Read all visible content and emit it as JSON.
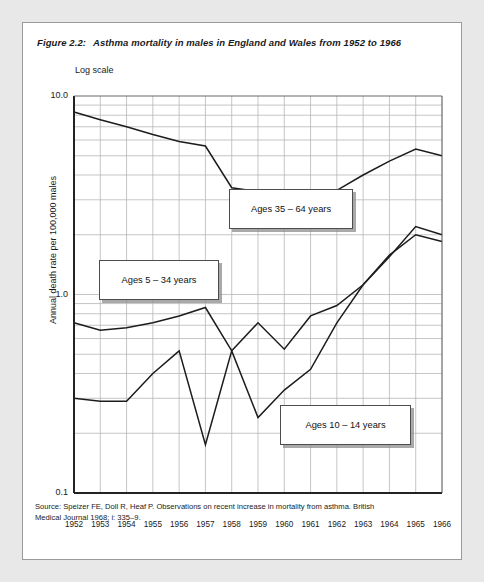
{
  "figure": {
    "number": "Figure 2.2:",
    "title": "Asthma mortality in males in England and Wales from 1952 to 1966",
    "scale_note": "Log scale"
  },
  "source": {
    "line1": "Source: Speizer FE, Doll R, Heaf P. Observations on recent increase in mortality from asthma. British",
    "line2": "Medical Journal 1968; i: 335–9."
  },
  "callouts": [
    {
      "id": "ages-35-64",
      "label": "Ages 35 – 64 years",
      "x": 228,
      "y": 188,
      "w": 124,
      "h": 40
    },
    {
      "id": "ages-5-34",
      "label": "Ages 5 – 34 years",
      "x": 98,
      "y": 259,
      "w": 120,
      "h": 40
    },
    {
      "id": "ages-10-14",
      "label": "Ages 10 – 14 years",
      "x": 279,
      "y": 404,
      "w": 131,
      "h": 40
    }
  ],
  "chart_data": {
    "type": "line",
    "title": "Asthma mortality in males in England and Wales from 1952 to 1966",
    "xlabel": "",
    "ylabel": "Annual death rate per 100,000 males",
    "yscale": "log",
    "ylim": [
      0.1,
      10.0
    ],
    "ytick_labels": [
      "10.0",
      "1.0",
      "0.1"
    ],
    "ytick_values": [
      10.0,
      1.0,
      0.1
    ],
    "grid": true,
    "legend": "inline-callouts",
    "x": [
      1952,
      1953,
      1954,
      1955,
      1956,
      1957,
      1958,
      1959,
      1960,
      1961,
      1962,
      1963,
      1964,
      1965,
      1966
    ],
    "categories": [
      "1952",
      "1953",
      "1954",
      "1955",
      "1956",
      "1957",
      "1958",
      "1959",
      "1960",
      "1961",
      "1962",
      "1963",
      "1964",
      "1965",
      "1966"
    ],
    "series": [
      {
        "name": "Ages 35 – 64 years",
        "values": [
          8.3,
          7.6,
          7.0,
          6.4,
          5.9,
          5.6,
          3.45,
          3.3,
          3.2,
          3.05,
          3.35,
          4.0,
          4.7,
          5.4,
          5.0
        ]
      },
      {
        "name": "Ages 5 – 34 years",
        "values": [
          0.72,
          0.66,
          0.68,
          0.72,
          0.78,
          0.86,
          0.52,
          0.72,
          0.53,
          0.78,
          0.88,
          1.12,
          1.55,
          2.2,
          2.0
        ]
      },
      {
        "name": "Ages 10 – 14 years",
        "values": [
          0.3,
          0.29,
          0.29,
          0.4,
          0.52,
          0.175,
          0.52,
          0.24,
          0.33,
          0.42,
          0.72,
          1.12,
          1.58,
          2.0,
          1.85
        ]
      }
    ]
  },
  "axis_geometry": {
    "plot_left": 73,
    "plot_right": 441,
    "plot_top": 95,
    "plot_bottom": 492,
    "y_top_value": 10.0,
    "y_bottom_value": 0.1
  }
}
